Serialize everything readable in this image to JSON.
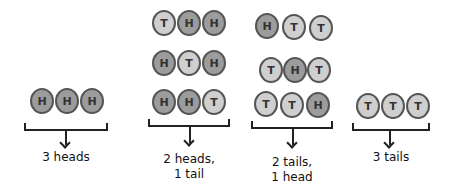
{
  "diagram": {
    "colors": {
      "heads": "#9c9c9c",
      "tails": "#cfcfcf",
      "outline": "#555555",
      "ink": "#222222"
    },
    "groups": [
      {
        "label_line1": "3 heads",
        "label_line2": "",
        "rows": [
          [
            "H",
            "H",
            "H"
          ]
        ]
      },
      {
        "label_line1": "2 heads,",
        "label_line2": "1 tail",
        "rows": [
          [
            "T",
            "H",
            "H"
          ],
          [
            "H",
            "T",
            "H"
          ],
          [
            "H",
            "H",
            "T"
          ]
        ]
      },
      {
        "label_line1": "2 tails,",
        "label_line2": "1 head",
        "rows": [
          [
            "H",
            "T",
            "T"
          ],
          [
            "T",
            "H",
            "T"
          ],
          [
            "T",
            "T",
            "H"
          ]
        ]
      },
      {
        "label_line1": "3 tails",
        "label_line2": "",
        "rows": [
          [
            "T",
            "T",
            "T"
          ]
        ]
      }
    ]
  }
}
